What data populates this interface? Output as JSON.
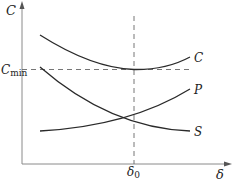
{
  "diagram": {
    "axes": {
      "y_label": "C",
      "x_label": "δ",
      "y_ref_label_main": "C",
      "y_ref_label_sub": "min",
      "x_ref_label_main": "δ",
      "x_ref_label_sub": "0"
    },
    "curves": [
      {
        "name": "C",
        "label": "C",
        "shape": "U-shaped, minimum at δ0 equal to Cmin"
      },
      {
        "name": "P",
        "label": "P",
        "shape": "increasing convex"
      },
      {
        "name": "S",
        "label": "S",
        "shape": "decreasing convex"
      }
    ],
    "colors": {
      "curve": "#2a2a2a",
      "axis": "#888888",
      "dashed": "#666666"
    }
  }
}
